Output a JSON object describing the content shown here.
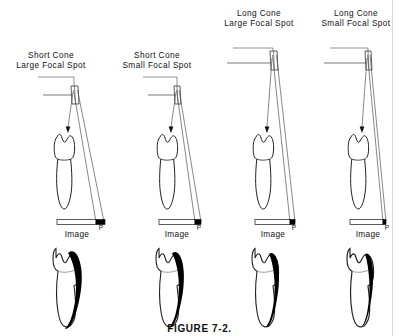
{
  "figure": {
    "caption": "FIGURE 7-2.",
    "image_label": "Image",
    "penumbra_label": "P"
  },
  "panels": [
    {
      "id": "short-cone-large-focal-spot",
      "title_line1": "Short Cone",
      "title_line2": "Large Focal Spot",
      "cone": "short",
      "focal_spot": "large",
      "penumbra_width_px": 9,
      "shadow_blur": "thick"
    },
    {
      "id": "short-cone-small-focal-spot",
      "title_line1": "Short Cone",
      "title_line2": "Small Focal Spot",
      "cone": "short",
      "focal_spot": "small",
      "penumbra_width_px": 6,
      "shadow_blur": "medium-thick"
    },
    {
      "id": "long-cone-large-focal-spot",
      "title_line1": "Long Cone",
      "title_line2": "Large Focal Spot",
      "cone": "long",
      "focal_spot": "large",
      "penumbra_width_px": 5,
      "shadow_blur": "medium"
    },
    {
      "id": "long-cone-small-focal-spot",
      "title_line1": "Long Cone",
      "title_line2": "Small Focal Spot",
      "cone": "long",
      "focal_spot": "small",
      "penumbra_width_px": 3,
      "shadow_blur": "thin"
    }
  ],
  "colors": {
    "ink": "#111111",
    "line": "#444444",
    "penumbra": "#000000",
    "background": "#ffffff",
    "page_edge": "#d8d8d8"
  }
}
